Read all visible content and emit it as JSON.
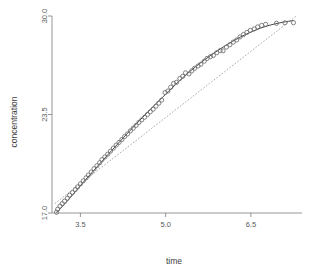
{
  "chart_data": {
    "type": "scatter",
    "title": "",
    "xlabel": "time",
    "ylabel": "concentration",
    "xlim": [
      3.0,
      7.4
    ],
    "ylim": [
      17.0,
      30.0
    ],
    "grid": false,
    "legend": "none",
    "x_ticks": [
      3.5,
      5.0,
      6.5
    ],
    "x_tick_labels": [
      "3.5",
      "5.0",
      "6.5"
    ],
    "y_ticks": [
      17.0,
      23.5,
      30.0
    ],
    "y_tick_labels": [
      "17.0",
      "23.5",
      "30.0"
    ],
    "marker": "open-circle",
    "point_count": 75,
    "series": [
      {
        "name": "observations",
        "type": "scatter",
        "x": [
          3.08,
          3.1,
          3.14,
          3.18,
          3.22,
          3.27,
          3.31,
          3.36,
          3.41,
          3.45,
          3.5,
          3.55,
          3.6,
          3.64,
          3.69,
          3.74,
          3.79,
          3.84,
          3.88,
          3.93,
          3.98,
          4.03,
          4.08,
          4.13,
          4.18,
          4.23,
          4.28,
          4.33,
          4.38,
          4.43,
          4.48,
          4.53,
          4.58,
          4.63,
          4.68,
          4.73,
          4.78,
          4.83,
          4.88,
          4.93,
          4.99,
          5.04,
          5.09,
          5.14,
          5.19,
          5.25,
          5.3,
          5.35,
          5.41,
          5.46,
          5.51,
          5.57,
          5.62,
          5.68,
          5.73,
          5.79,
          5.84,
          5.9,
          5.96,
          6.01,
          6.07,
          6.13,
          6.19,
          6.25,
          6.31,
          6.37,
          6.43,
          6.49,
          6.56,
          6.62,
          6.69,
          6.76,
          6.95,
          7.1,
          7.25
        ],
        "y": [
          17.05,
          17.25,
          17.45,
          17.62,
          17.78,
          17.98,
          18.18,
          18.35,
          18.55,
          18.72,
          18.92,
          19.12,
          19.32,
          19.5,
          19.7,
          19.92,
          20.12,
          20.32,
          20.52,
          20.7,
          20.88,
          21.08,
          21.28,
          21.48,
          21.66,
          21.85,
          22.05,
          22.22,
          22.42,
          22.6,
          22.78,
          22.98,
          23.15,
          23.32,
          23.5,
          23.68,
          23.85,
          24.05,
          24.25,
          24.45,
          24.95,
          25.05,
          25.3,
          25.55,
          25.62,
          25.88,
          26.02,
          26.25,
          26.18,
          26.38,
          26.55,
          26.7,
          26.82,
          27.02,
          27.2,
          27.32,
          27.4,
          27.58,
          27.72,
          27.7,
          27.95,
          28.1,
          28.28,
          28.42,
          28.62,
          28.78,
          28.92,
          29.05,
          29.15,
          29.28,
          29.38,
          29.45,
          29.52,
          29.55,
          29.56
        ]
      },
      {
        "name": "fitted-curve",
        "type": "line",
        "style": "solid",
        "x": [
          3.08,
          3.3,
          3.55,
          3.8,
          4.05,
          4.3,
          4.55,
          4.8,
          5.05,
          5.3,
          5.55,
          5.8,
          6.05,
          6.3,
          6.55,
          6.8,
          7.05,
          7.25
        ],
        "y": [
          17.02,
          17.92,
          19.02,
          20.08,
          21.12,
          22.15,
          23.14,
          24.1,
          25.02,
          25.92,
          26.72,
          27.42,
          28.04,
          28.58,
          29.02,
          29.36,
          29.58,
          29.7
        ]
      },
      {
        "name": "regression-line",
        "type": "line",
        "style": "dotted",
        "x": [
          3.05,
          7.3
        ],
        "y": [
          17.62,
          30.0
        ]
      }
    ]
  },
  "axes": {
    "x_title": "time",
    "y_title": "concentration"
  }
}
